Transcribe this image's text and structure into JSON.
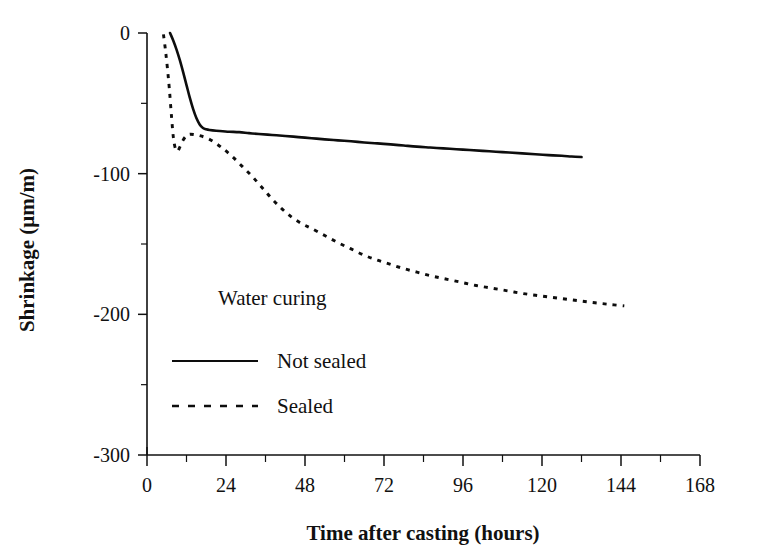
{
  "chart_data": {
    "type": "line",
    "title": "",
    "xlabel": "Time after casting (hours)",
    "ylabel": "Shrinkage (μm/m)",
    "xlim": [
      0,
      168
    ],
    "ylim": [
      -300,
      0
    ],
    "grid": false,
    "legend_position": "center-left-inside",
    "legend_title": "Water curing",
    "xticks": [
      0,
      24,
      48,
      72,
      96,
      120,
      144,
      168
    ],
    "xtick_labels": [
      "0",
      "24",
      "48",
      "72",
      "96",
      "120",
      "144",
      "168"
    ],
    "xticks_minor": [
      12,
      36,
      60,
      84,
      108,
      132,
      156
    ],
    "yticks": [
      0,
      -100,
      -200,
      -300
    ],
    "ytick_labels": [
      "0",
      "-100",
      "-200",
      "-300"
    ],
    "yticks_minor": [
      -50,
      -150,
      -250
    ],
    "series": [
      {
        "name": "Not sealed",
        "style": "solid",
        "color": "#0d0d0d",
        "x": [
          7.0,
          8.0,
          9.0,
          10.0,
          11.0,
          12.0,
          13.0,
          14.0,
          15.0,
          16.0,
          17.0,
          18.0,
          19.0,
          21.0,
          23.0,
          25.0,
          28.0,
          31.0,
          34.0,
          38.0,
          42.0,
          46.0,
          50.0,
          54.0,
          58.0,
          62.0,
          66.0,
          70.0,
          74.0,
          78.0,
          82.0,
          86.0,
          90.0,
          94.0,
          98.0,
          102.0,
          106.0,
          110.0,
          114.0,
          118.0,
          122.0,
          126.0,
          129.0,
          132.0
        ],
        "y": [
          0.0,
          -5.5,
          -12.0,
          -19.5,
          -28.0,
          -37.0,
          -46.0,
          -54.0,
          -60.5,
          -65.0,
          -67.5,
          -68.5,
          -69.0,
          -69.5,
          -69.8,
          -70.2,
          -70.5,
          -71.2,
          -71.8,
          -72.5,
          -73.2,
          -74.0,
          -74.8,
          -75.6,
          -76.3,
          -77.0,
          -77.8,
          -78.5,
          -79.2,
          -80.0,
          -80.8,
          -81.4,
          -82.0,
          -82.6,
          -83.2,
          -83.8,
          -84.4,
          -85.0,
          -85.6,
          -86.2,
          -86.8,
          -87.3,
          -87.8,
          -88.2
        ]
      },
      {
        "name": "Sealed",
        "style": "dashed",
        "color": "#0d0d0d",
        "x": [
          5.0,
          5.6,
          6.2,
          6.8,
          7.4,
          8.0,
          8.6,
          9.3,
          10.0,
          11.0,
          12.0,
          13.0,
          14.5,
          16.0,
          18.0,
          20.0,
          23.0,
          26.0,
          29.0,
          32.0,
          35.0,
          38.0,
          41.0,
          44.0,
          47.0,
          50.0,
          54.0,
          58.0,
          62.0,
          66.0,
          70.0,
          74.0,
          78.0,
          82.0,
          86.0,
          90.0,
          95.0,
          100.0,
          105.0,
          110.0,
          115.0,
          120.0,
          125.0,
          130.0,
          135.0,
          140.0,
          145.0
        ],
        "y": [
          -1.0,
          -12.0,
          -25.0,
          -40.0,
          -58.0,
          -74.0,
          -82.0,
          -84.0,
          -81.0,
          -76.0,
          -73.0,
          -72.0,
          -72.3,
          -73.0,
          -74.5,
          -77.0,
          -82.0,
          -88.0,
          -95.0,
          -102.0,
          -110.0,
          -118.0,
          -125.0,
          -131.0,
          -135.5,
          -139.0,
          -144.0,
          -149.0,
          -153.5,
          -158.0,
          -161.5,
          -164.5,
          -167.5,
          -170.0,
          -172.5,
          -174.5,
          -177.0,
          -179.5,
          -181.5,
          -183.5,
          -185.5,
          -187.0,
          -188.5,
          -190.0,
          -191.5,
          -192.8,
          -194.0
        ]
      }
    ]
  },
  "legend": {
    "title": "Water curing",
    "items": [
      {
        "label": "Not sealed",
        "style": "solid"
      },
      {
        "label": "Sealed",
        "style": "dashed"
      }
    ]
  }
}
